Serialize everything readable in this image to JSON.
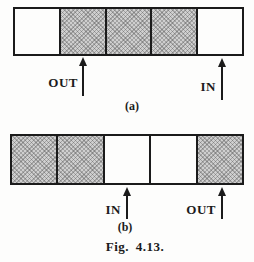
{
  "figure": {
    "caption": "Fig. 4.13.",
    "colors": {
      "shaded_fill": "#b8b8b8",
      "outline": "#1b1b1b",
      "background": "#fdfdfc"
    },
    "panels": [
      {
        "label": "(a)",
        "cells": [
          "empty",
          "shaded",
          "shaded",
          "shaded",
          "empty"
        ],
        "out_label": "OUT",
        "in_label": "IN",
        "out_arrow_points_to_cell": 2,
        "in_arrow_points_to_cell": 5
      },
      {
        "label": "(b)",
        "cells": [
          "shaded",
          "shaded",
          "empty",
          "empty",
          "shaded"
        ],
        "in_label": "IN",
        "out_label": "OUT",
        "in_arrow_points_to_cell": 3,
        "out_arrow_points_to_cell": 5
      }
    ]
  }
}
